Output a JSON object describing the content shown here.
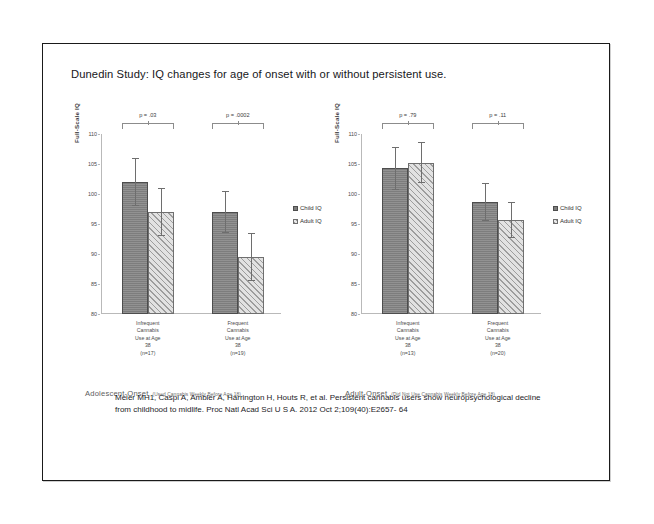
{
  "slide": {
    "title": "Dunedin Study: IQ changes for age of onset with or without persistent use."
  },
  "legend": {
    "child": "Child IQ",
    "adult": "Adult IQ",
    "child_marker": "filled-square-marker",
    "adult_marker": "hatched-square-marker"
  },
  "axis": {
    "ylabel": "Full-Scale IQ",
    "ticks": [
      "110",
      "105",
      "100",
      "95",
      "90",
      "85",
      "80"
    ]
  },
  "panels": {
    "left": {
      "onset_label": "Adolescent-Onset",
      "onset_note": "(Used Cannabis Weekly Before Age 18)",
      "groups": [
        {
          "label_lines": [
            "Infrequent",
            "Cannabis",
            "Use at Age",
            "38"
          ],
          "n": "(n=17)",
          "pvalue": "p = .03"
        },
        {
          "label_lines": [
            "Frequent",
            "Cannabis",
            "Use at Age",
            "38"
          ],
          "n": "(n=19)",
          "pvalue": "p = .0002"
        }
      ]
    },
    "right": {
      "onset_label": "Adult-Onset",
      "onset_note": "(Did Not Use Cannabis Weekly Before Age 18)",
      "groups": [
        {
          "label_lines": [
            "Infrequent",
            "Cannabis",
            "Use at Age",
            "38"
          ],
          "n": "(n=13)",
          "pvalue": "p = .79"
        },
        {
          "label_lines": [
            "Frequent",
            "Cannabis",
            "Use at Age",
            "38"
          ],
          "n": "(n=20)",
          "pvalue": "p = .11"
        }
      ]
    }
  },
  "citation": {
    "line1": "Meier MH1, Caspi A, Ambler A, Harrington H, Houts R, et al. Persistent cannabis users show",
    "line2": "neuropsychological decline from childhood to midlife. Proc Natl Acad Sci U S A. 2012 Oct 2;109(40):E2657-",
    "line3": "64"
  },
  "chart_data": [
    {
      "type": "bar",
      "title": "Adolescent-Onset (Used Cannabis Weekly Before Age 18)",
      "xlabel": "",
      "ylabel": "Full-Scale IQ",
      "ylim": [
        80,
        110
      ],
      "yticks": [
        80,
        85,
        90,
        95,
        100,
        105,
        110
      ],
      "grid": false,
      "legend_position": "right",
      "categories": [
        "Infrequent Cannabis Use at Age 38 (n=17)",
        "Frequent Cannabis Use at Age 38 (n=19)"
      ],
      "series": [
        {
          "name": "Child IQ",
          "values": [
            102.0,
            97.0
          ],
          "errors": [
            4.0,
            3.5
          ]
        },
        {
          "name": "Adult IQ",
          "values": [
            97.0,
            89.5
          ],
          "errors": [
            4.0,
            4.0
          ]
        }
      ],
      "annotations": [
        "p = .03",
        "p = .0002"
      ]
    },
    {
      "type": "bar",
      "title": "Adult-Onset (Did Not Use Cannabis Weekly Before Age 18)",
      "xlabel": "",
      "ylabel": "Full-Scale IQ",
      "ylim": [
        80,
        110
      ],
      "yticks": [
        80,
        85,
        90,
        95,
        100,
        105,
        110
      ],
      "grid": false,
      "legend_position": "right",
      "categories": [
        "Infrequent Cannabis Use at Age 38 (n=13)",
        "Frequent Cannabis Use at Age 38 (n=20)"
      ],
      "series": [
        {
          "name": "Child IQ",
          "values": [
            104.3,
            98.7
          ],
          "errors": [
            3.6,
            3.2
          ]
        },
        {
          "name": "Adult IQ",
          "values": [
            105.2,
            95.7
          ],
          "errors": [
            3.4,
            3.0
          ]
        }
      ],
      "annotations": [
        "p = .79",
        "p = .11"
      ]
    }
  ]
}
